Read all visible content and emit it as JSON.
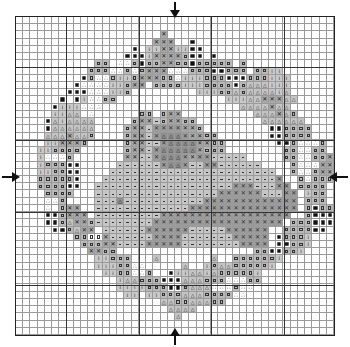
{
  "pattern": {
    "title": "Bunny in wreath cross-stitch chart",
    "grid_size": [
      44,
      44
    ],
    "heavy_lines": [
      7,
      17,
      27,
      37
    ],
    "center_markers": [
      "top",
      "bottom",
      "left",
      "right"
    ],
    "legend": {
      ".": "empty",
      "B": "black-filled",
      "S": "square-on-gray",
      "W": "square-on-white",
      "T": "dots-on-white",
      "A": "triangle-on-gray",
      "I": "i-mark-on-gray",
      "X": "cross-stitch-dark",
      "D": "dash-light-gray",
      "K": "crosshatch-shading",
      "G": "triangle-dark-gray"
    },
    "rows": [
      "............................................",
      "............................................",
      "....................X.......................",
      "...................XXX..B...................",
      "................B.IIXXIIBB..................",
      "...............BBBIXXXXSBB.B................",
      "...........SS.TTSBSSXXSSBSSSSS.S............",
      "..........SSSTTSTSXXXTTTSSSBBSSS.SSII.......",
      ".........BSTTSIISXXXSSTIIISSSBBBSSSIII......",
      "........BTTTTIISXX.SSSSIIISSSSBSAAAIII......",
      ".......BBBTTTIIS.........IIISSASAAAAIA......",
      "......B.BITTSS...............IIIAAXXXAA.....",
      ".....BIIITTT...................AAAAXAA......",
      ".....IIAA.T......SS.SXX..........AAAXAS.....",
      "....BAIAAAA.....SXXDSXXSS.........AAAAAA....",
      "....BAAAAAA....SXXDKKKKXXS.........BBSSSS...",
      "....AAAXAAS....SXXDKGGGKXXSS.......BBSSSS...",
      "....IIXXXS.....SXXDDKGGGGXXSS.......BBSTTTS.",
      "...IISSSS......SXXDKGGGGGXSSS........SSTTSS.",
      "...ITTTS.......XXDDKGGGKXKKDDDDD.....SSTTSSX.",
      "...ISSSBB.....DDDDDDKGGKDDKKDDDDDD....STTTXXX",
      "...IISSBB....DDDDDDDDDDDDDDDDDDDDDDD..STTSXX.",
      "...SSSSSB...DDDDDDDDDDDDDDDDDDDDDDDDK..STSSS.",
      "...SSSSBB..DDDDDDDDDDDDDDDDDDDKKKDDDKK.SSSS..",
      "....SSSS...DDDDDDDDDDDDDDDDDKKKKKKDDDKK.ISS..",
      "....TTS....DDDGDDDDDDDDDDDKKKKKKKKKKKKK.SSS..",
      "....T.SXX..DDDDDDDDDDDDDKKKKKKKKKKKKKKK.SBSS.",
      "....BBSXXX.DDDDDDDDDKKKKKKKKKKKKKKKKKK..SBBB.",
      "....BBSAXXSDDDDDDDDKKKKKKKKKKKKKKKKKK.SSSBBB.",
      ".....BBSAXX.DDDDDDKKKKKKDDDDDKKKKKK..SSSSBB..",
      "........SSWWXDDDDDDKKKKDDDDDDDKKKKK.BSSSI....",
      ".........SSSXXDDDDKKKKKDDDDDDDDKKKK.BBSSI....",
      "..........XXSS...................SSBBSSI.....",
      "...........IISSS...A.......A..SSSSSSI.......",
      "...........IIISSTT.....A..ISAASSSSSI........",
      "............IISSTTS..BIIAAIASSSSSI..........",
      "..............IAASSSBBBAAASSSTTTSS..........",
      "..............IIIISSSBBSAAATTTSTT...........",
      "...............II.IISSSAAASSSSTT............",
      "....................AASSAAASS...............",
      ".....................AAAA...................",
      "......................A.....................",
      "............................................",
      "............................................"
    ]
  }
}
